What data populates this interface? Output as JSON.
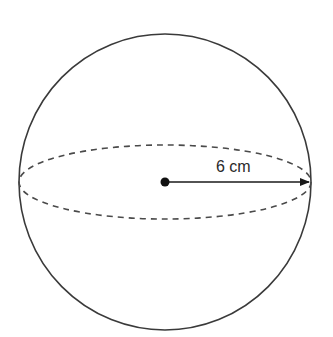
{
  "diagram": {
    "type": "sphere",
    "radius_label": "6 cm",
    "colors": {
      "stroke": "#3a3a3a",
      "dashed": "#4a4a4a",
      "arrow": "#1a1a1a",
      "background": "#ffffff"
    },
    "geometry": {
      "center": [
        165,
        182
      ],
      "sphere_rx": 146,
      "sphere_ry": 148,
      "equator_rx": 146,
      "equator_ry": 37,
      "arrow_end_x": 309,
      "center_dot_r": 4.5,
      "label_pos": [
        216,
        172
      ]
    }
  }
}
